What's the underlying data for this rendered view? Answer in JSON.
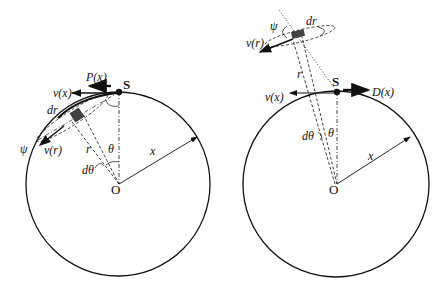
{
  "figure": {
    "left_panel": {
      "source_label": "S",
      "center_label": "O",
      "force_label": "P(x)",
      "velocity_x_label": "v(x)",
      "velocity_r_label": "v(r)",
      "element_width_label": "dr",
      "angle_psi_label": "ψ",
      "radius_r_label": "r",
      "angle_theta_label": "θ",
      "angle_dtheta_label": "dθ",
      "radius_x_label": "x"
    },
    "right_panel": {
      "source_label": "S",
      "center_label": "O",
      "force_label": "D(x)",
      "velocity_x_label": "v(x)",
      "velocity_r_label": "v(r)",
      "element_width_label": "dr",
      "angle_psi_label": "ψ",
      "radius_r_label": "r",
      "angle_theta_label": "θ",
      "angle_dtheta_label": "dθ",
      "radius_x_label": "x"
    }
  }
}
